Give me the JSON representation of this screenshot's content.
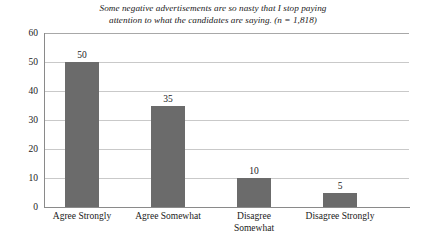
{
  "chart_data": {
    "type": "bar",
    "title": "Some negative advertisements are so nasty that I stop paying attention to what the candidates are saying. (n = 1,818)",
    "title_lines": [
      "Some negative advertisements are so nasty that I stop paying",
      "attention to what the candidates are saying. (n = 1,818)"
    ],
    "categories": [
      "Agree Strongly",
      "Agree Somewhat",
      "Disagree Somewhat",
      "Disagree Strongly"
    ],
    "category_lines": [
      [
        "Agree Strongly"
      ],
      [
        "Agree Somewhat"
      ],
      [
        "Disagree",
        "Somewhat"
      ],
      [
        "Disagree Strongly"
      ]
    ],
    "values": [
      50,
      35,
      10,
      5
    ],
    "value_labels": [
      "50",
      "35",
      "10",
      "5"
    ],
    "xlabel": "",
    "ylabel": "",
    "ylim": [
      0,
      60
    ],
    "yticks": [
      0,
      10,
      20,
      30,
      40,
      50,
      60
    ],
    "ytick_labels": [
      "0",
      "10",
      "20",
      "30",
      "40",
      "50",
      "60"
    ],
    "grid": "horizontal",
    "legend": "none",
    "bar_color": "#6b6b6b",
    "grid_color": "#c9c9c9",
    "axis_color": "#8a8a8a",
    "text_color": "#1a1a1a",
    "background": "#ffffff"
  }
}
